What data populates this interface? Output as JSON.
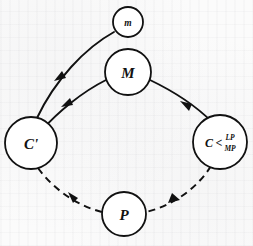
{
  "figure": {
    "type": "graph-diagram",
    "background_color": "#fbfbfb",
    "ink_color": "#111111",
    "width": 253,
    "height": 246
  },
  "nodes": [
    {
      "id": "m",
      "label": "m",
      "cx": 128,
      "cy": 22,
      "r": 15,
      "label_style": "small"
    },
    {
      "id": "M",
      "label": "M",
      "cx": 128,
      "cy": 72,
      "r": 23,
      "label_style": "main"
    },
    {
      "id": "Cp",
      "label": "C'",
      "cx": 31,
      "cy": 143,
      "r": 26,
      "label_style": "main"
    },
    {
      "id": "Cmp",
      "label": "C",
      "label_super": "LP",
      "label_sub": "MP",
      "label_rel": "<",
      "cx": 220,
      "cy": 142,
      "r": 27,
      "label_style": "compound"
    },
    {
      "id": "P",
      "label": "P",
      "cx": 124,
      "cy": 214,
      "r": 22,
      "label_style": "main"
    }
  ],
  "edges": [
    {
      "id": "m-to-Cp",
      "from": "m",
      "to": "Cp",
      "style": "solid",
      "arrow": "to-Cp",
      "arrow_at_mid": true
    },
    {
      "id": "M-to-Cp",
      "from": "M",
      "to": "Cp",
      "style": "solid",
      "arrow": "to-Cp",
      "arrow_at_mid": true
    },
    {
      "id": "M-to-Cmp",
      "from": "M",
      "to": "Cmp",
      "style": "solid",
      "arrow": "to-Cmp",
      "arrow_at_mid": true
    },
    {
      "id": "Cp-to-P",
      "from": "Cp",
      "to": "P",
      "style": "dashed",
      "arrow": "to-P",
      "arrow_at_mid": true
    },
    {
      "id": "Cmp-to-P",
      "from": "Cmp",
      "to": "P",
      "style": "dashed",
      "arrow": "to-P",
      "arrow_at_mid": true
    }
  ],
  "labels": {
    "node_m": "m",
    "node_M": "M",
    "node_Cprime": "C'",
    "node_C_base": "C",
    "node_C_relation": "<",
    "node_C_super": "LP",
    "node_C_sub": "MP",
    "node_P": "P"
  }
}
